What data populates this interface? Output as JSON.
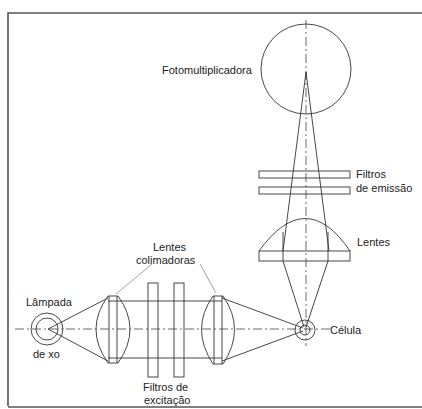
{
  "diagram": {
    "type": "optical-schematic",
    "labels": {
      "photomultiplier": "Fotomultiplicadora",
      "emission_filters_line1": "Filtros",
      "emission_filters_line2": "de emissão",
      "emission_lens": "Lentes",
      "collimating_lenses_line1": "Lentes",
      "collimating_lenses_line2": "colimadoras",
      "lamp_line1": "Lâmpada",
      "lamp_line2": "de xo",
      "cell": "Célula",
      "excitation_filters_line1": "Filtros de",
      "excitation_filters_line2": "excitação"
    },
    "components": [
      {
        "id": "lamp",
        "label": "Lâmpada de xo",
        "shape": "concentric-circles"
      },
      {
        "id": "collimating-lens-1",
        "label": "Lentes colimadoras",
        "shape": "biconvex-lens"
      },
      {
        "id": "excitation-filter-1",
        "label": "Filtros de excitação",
        "shape": "rectangle"
      },
      {
        "id": "excitation-filter-2",
        "label": "Filtros de excitação",
        "shape": "rectangle"
      },
      {
        "id": "collimating-lens-2",
        "label": "Lentes colimadoras",
        "shape": "biconvex-lens"
      },
      {
        "id": "cell",
        "label": "Célula",
        "shape": "concentric-circles"
      },
      {
        "id": "emission-lens",
        "label": "Lentes",
        "shape": "plano-convex-lens"
      },
      {
        "id": "emission-filter-1",
        "label": "Filtros de emissão",
        "shape": "rectangle"
      },
      {
        "id": "emission-filter-2",
        "label": "Filtros de emissão",
        "shape": "rectangle"
      },
      {
        "id": "photomultiplier",
        "label": "Fotomultiplicadora",
        "shape": "circle"
      }
    ],
    "colors": {
      "line": "#333333",
      "text": "#222222",
      "background": "#ffffff"
    }
  }
}
